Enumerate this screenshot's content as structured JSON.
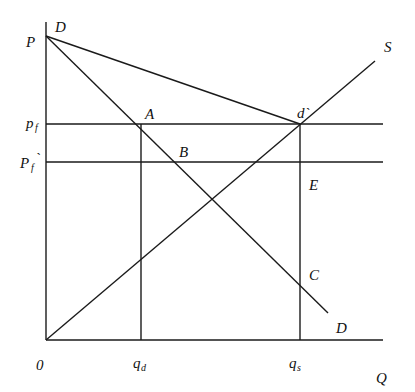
{
  "diagram": {
    "axes": {
      "y_label": "P",
      "x_label": "Q",
      "origin_label": "0"
    },
    "price_labels": {
      "pf_main": "p",
      "pf_sub": "f",
      "pf_prime_main": "P",
      "pf_prime_sub": "f",
      "pf_prime_mark": "`"
    },
    "quantity_labels": {
      "qd_main": "q",
      "qd_sub": "d",
      "qs_main": "q",
      "qs_sub": "s"
    },
    "curve_labels": {
      "demand_top": "D",
      "demand_bottom": "D",
      "supply": "S"
    },
    "point_labels": {
      "A": "A",
      "B": "B",
      "d_prime": "d`",
      "E": "E",
      "C": "C"
    },
    "colors": {
      "line": "#1a1a1a",
      "background": "#ffffff"
    }
  }
}
